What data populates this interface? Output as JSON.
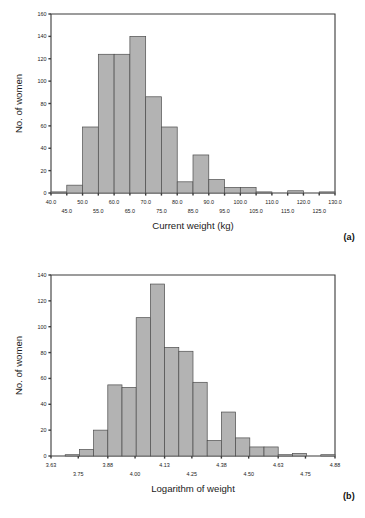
{
  "figure": {
    "panels": [
      {
        "id": "a",
        "panel_label": "(a)",
        "chart_data": {
          "type": "bar",
          "title": "",
          "subtitle": "",
          "xlabel": "Current weight (kg)",
          "ylabel": "No. of women",
          "xlim": [
            40.0,
            130.0
          ],
          "ylim": [
            0,
            160
          ],
          "ytick_values": [
            0,
            20,
            40,
            60,
            80,
            100,
            120,
            140,
            160
          ],
          "ytick_labels": [
            "0",
            "20",
            "40",
            "60",
            "80",
            "100",
            "120",
            "140",
            "160"
          ],
          "xtick_values": [
            40.0,
            45.0,
            50.0,
            55.0,
            60.0,
            65.0,
            70.0,
            75.0,
            80.0,
            85.0,
            90.0,
            95.0,
            100.0,
            105.0,
            110.0,
            115.0,
            120.0,
            125.0,
            130.0
          ],
          "xtick_labels": [
            "40.0",
            "45.0",
            "50.0",
            "55.0",
            "60.0",
            "65.0",
            "70.0",
            "75.0",
            "80.0",
            "85.0",
            "90.0",
            "95.0",
            "100.0",
            "105.0",
            "110.0",
            "115.0",
            "120.0",
            "125.0",
            "130.0"
          ],
          "xtick_label_rows": 2,
          "grid": false,
          "legend": false,
          "bin_width": 5.0,
          "bin_starts": [
            40.0,
            45.0,
            50.0,
            55.0,
            60.0,
            65.0,
            70.0,
            75.0,
            80.0,
            85.0,
            90.0,
            95.0,
            100.0,
            105.0,
            110.0,
            115.0,
            120.0,
            125.0
          ],
          "values": [
            1,
            7,
            59,
            124,
            124,
            140,
            86,
            59,
            10,
            34,
            12,
            5,
            5,
            1,
            0,
            2,
            0,
            1
          ]
        }
      },
      {
        "id": "b",
        "panel_label": "(b)",
        "chart_data": {
          "type": "bar",
          "title": "",
          "subtitle": "",
          "xlabel": "Logarithm of weight",
          "ylabel": "No. of women",
          "xlim": [
            3.63,
            4.88
          ],
          "ylim": [
            0,
            140
          ],
          "ytick_values": [
            0,
            20,
            40,
            60,
            80,
            100,
            120,
            140
          ],
          "ytick_labels": [
            "0",
            "20",
            "40",
            "60",
            "80",
            "100",
            "120",
            "140"
          ],
          "xtick_values": [
            3.63,
            3.75,
            3.88,
            4.0,
            4.13,
            4.25,
            4.38,
            4.5,
            4.63,
            4.75,
            4.88
          ],
          "xtick_labels": [
            "3.63",
            "3.75",
            "3.88",
            "4.00",
            "4.13",
            "4.25",
            "4.38",
            "4.50",
            "4.63",
            "4.75",
            "4.88"
          ],
          "xtick_label_rows": 2,
          "grid": false,
          "legend": false,
          "bin_width": 0.0625,
          "bin_starts": [
            3.63,
            3.6925,
            3.755,
            3.8175,
            3.88,
            3.9425,
            4.005,
            4.0675,
            4.13,
            4.1925,
            4.255,
            4.3175,
            4.38,
            4.4425,
            4.505,
            4.5675,
            4.63,
            4.6925,
            4.755,
            4.8175
          ],
          "values": [
            0,
            1,
            5,
            20,
            55,
            53,
            107,
            133,
            84,
            81,
            57,
            12,
            34,
            14,
            7,
            7,
            1,
            2,
            0,
            1
          ]
        }
      }
    ],
    "colors": {
      "bar_fill": "#b3b3b3",
      "bar_stroke": "#4d4d4d",
      "axis": "#3a3a3a",
      "text": "#1a1a1a",
      "background": "#ffffff"
    }
  }
}
